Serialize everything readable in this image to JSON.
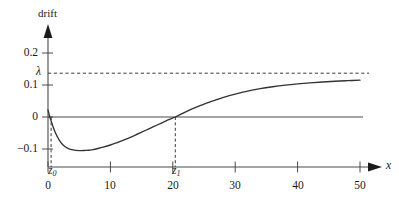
{
  "chart_data": {
    "type": "line",
    "title": "",
    "ylabel": "drift",
    "xlabel": "x",
    "xlim": [
      0,
      50
    ],
    "ylim": [
      -0.15,
      0.23
    ],
    "grid": false,
    "legend": null,
    "x_ticks": [
      {
        "value": 0,
        "label": "0"
      },
      {
        "value": 10,
        "label": "10"
      },
      {
        "value": 20,
        "label": "20"
      },
      {
        "value": 30,
        "label": "30"
      },
      {
        "value": 40,
        "label": "40"
      },
      {
        "value": 50,
        "label": "50"
      }
    ],
    "y_ticks": [
      {
        "value": 0.2,
        "label": "0.2"
      },
      {
        "value": 0.1,
        "label": "0.1"
      },
      {
        "value": 0.0,
        "label": "0"
      },
      {
        "value": -0.1,
        "label": "−0.1"
      }
    ],
    "annotations": [
      {
        "name": "lambda-level",
        "label": "λ",
        "type": "horizontal-dashed-line",
        "y": 0.137
      },
      {
        "name": "z0-marker",
        "label": "z",
        "sub": "0",
        "type": "vertical-dashed-line",
        "x": 0.5
      },
      {
        "name": "z1-marker",
        "label": "z",
        "sub": "1",
        "type": "vertical-dashed-line",
        "x": 20.4
      },
      {
        "name": "zero-line",
        "label": "",
        "type": "horizontal-line",
        "y": 0.0
      }
    ],
    "series": [
      {
        "name": "drift",
        "color": "#333333",
        "x": [
          0,
          0.3,
          0.5,
          0.8,
          1.2,
          1.8,
          2.5,
          3.2,
          4,
          5,
          6,
          6.5,
          7,
          8,
          9,
          10,
          11,
          12,
          13,
          14,
          15,
          16,
          17,
          18,
          19,
          20,
          20.4,
          21,
          22,
          23,
          24,
          25,
          26,
          27,
          28,
          30,
          32,
          34,
          36,
          38,
          40,
          42,
          44,
          46,
          48,
          50
        ],
        "y": [
          0.022,
          0.0,
          -0.012,
          -0.03,
          -0.05,
          -0.072,
          -0.089,
          -0.098,
          -0.103,
          -0.105,
          -0.1045,
          -0.104,
          -0.1025,
          -0.0985,
          -0.0935,
          -0.0875,
          -0.0805,
          -0.073,
          -0.065,
          -0.0565,
          -0.0475,
          -0.0385,
          -0.0295,
          -0.0205,
          -0.0115,
          -0.0025,
          0.0,
          0.006,
          0.0155,
          0.0245,
          0.0325,
          0.0405,
          0.0475,
          0.054,
          0.0605,
          0.0715,
          0.081,
          0.0885,
          0.0945,
          0.0995,
          0.1035,
          0.1068,
          0.1095,
          0.1118,
          0.1135,
          0.115
        ]
      }
    ]
  },
  "labels": {
    "y_axis_title": "drift",
    "x_axis_title": "x",
    "lambda": "λ",
    "z0_base": "z",
    "z0_sub": "0",
    "z1_base": "z",
    "z1_sub": "1",
    "ytick_0": "0.2",
    "ytick_1": "0.1",
    "ytick_2": "0",
    "ytick_3": "−0.1",
    "xtick_0": "0",
    "xtick_1": "10",
    "xtick_2": "20",
    "xtick_3": "30",
    "xtick_4": "40",
    "xtick_5": "50"
  },
  "colors": {
    "curve": "#333333",
    "axis": "#4a4a4a",
    "text": "#1a1a1a",
    "background": "#ffffff"
  }
}
